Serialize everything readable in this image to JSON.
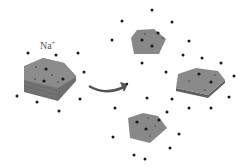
{
  "diagram": {
    "ion_label": "Na",
    "ion_charge": "+",
    "colors": {
      "sheet_top": "#8a8a8a",
      "sheet_side": "#6e6e6e",
      "ion": "#1a1a1a",
      "arrow": "#555555",
      "background": "#ffffff"
    },
    "stack": {
      "label": "layered-stack",
      "layers": 4
    },
    "sheets": [
      {
        "name": "sheet-top"
      },
      {
        "name": "sheet-right"
      },
      {
        "name": "sheet-bottom"
      }
    ]
  }
}
